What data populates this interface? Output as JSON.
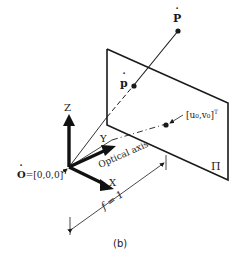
{
  "figure": {
    "caption": "(b)",
    "labels": {
      "point_world": "P",
      "point_image": "p",
      "principal_point": "[u₀,v₀]",
      "principal_point_sup": "T",
      "axis_z": "Z",
      "axis_y": "Y",
      "axis_x": "X",
      "optical_axis": "Optical axis",
      "origin": "O=[0,0,0]",
      "origin_sup": "T",
      "image_plane": "Π",
      "focal_length": "f = 1"
    }
  }
}
